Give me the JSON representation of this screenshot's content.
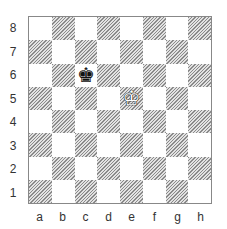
{
  "diagram": {
    "caption": "",
    "files": [
      "a",
      "b",
      "c",
      "d",
      "e",
      "f",
      "g",
      "h"
    ],
    "ranks": [
      "8",
      "7",
      "6",
      "5",
      "4",
      "3",
      "2",
      "1"
    ],
    "pieces": [
      {
        "square": "c6",
        "piece": "king",
        "color": "black",
        "glyph": "♚"
      },
      {
        "square": "e5",
        "piece": "king",
        "color": "white",
        "glyph": "♔"
      }
    ],
    "colors": {
      "light_square": "#ffffff",
      "dark_square_hatch": "#8a8a8a",
      "border": "#888888"
    }
  }
}
